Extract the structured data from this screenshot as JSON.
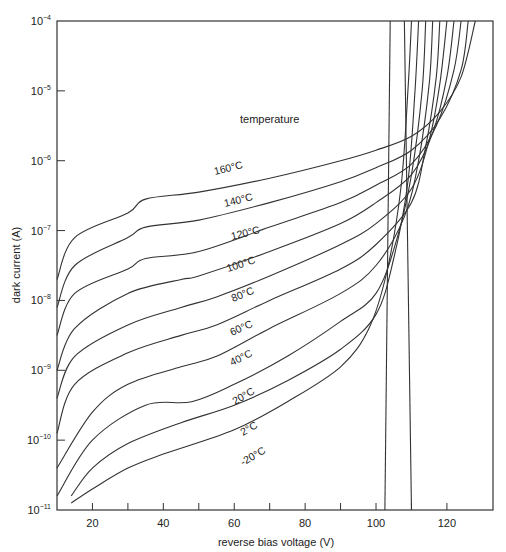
{
  "chart_data": {
    "type": "line",
    "title": "",
    "xlabel": "reverse bias voltage (V)",
    "ylabel": "dark current (A)",
    "xlim": [
      10,
      133
    ],
    "ylim_log10": [
      -11,
      -4
    ],
    "yscale": "log",
    "grid": false,
    "annotation": "temperature",
    "x_ticks": [
      20,
      30,
      40,
      50,
      60,
      70,
      80,
      90,
      100,
      110,
      120
    ],
    "x_tick_labels": [
      "20",
      "",
      "40",
      "",
      "60",
      "",
      "80",
      "",
      "100",
      "",
      "120"
    ],
    "y_ticks": [
      {
        "base": "10",
        "exp": "-4"
      },
      {
        "base": "10",
        "exp": "-5"
      },
      {
        "base": "10",
        "exp": "-6"
      },
      {
        "base": "10",
        "exp": "-7"
      },
      {
        "base": "10",
        "exp": "-8"
      },
      {
        "base": "10",
        "exp": "-9"
      },
      {
        "base": "10",
        "exp": "-10"
      },
      {
        "base": "10",
        "exp": "-11"
      }
    ],
    "series": [
      {
        "name": "160°C",
        "label": "160°C",
        "x": [
          10,
          15,
          30,
          35,
          50,
          70,
          90,
          100,
          110,
          118,
          124,
          128
        ],
        "log10_y": [
          -7.7,
          -7.1,
          -6.75,
          -6.55,
          -6.45,
          -6.25,
          -6.0,
          -5.85,
          -5.65,
          -5.3,
          -4.8,
          -4.0
        ]
      },
      {
        "name": "140°C",
        "label": "140°C",
        "x": [
          10,
          15,
          30,
          35,
          50,
          70,
          90,
          100,
          110,
          118,
          124,
          126
        ],
        "log10_y": [
          -8.1,
          -7.5,
          -7.1,
          -6.95,
          -6.85,
          -6.6,
          -6.3,
          -6.1,
          -5.85,
          -5.4,
          -4.7,
          -4.0
        ]
      },
      {
        "name": "120°C",
        "label": "120°C",
        "x": [
          10,
          15,
          30,
          35,
          50,
          70,
          90,
          100,
          110,
          117,
          122,
          124
        ],
        "log10_y": [
          -8.5,
          -7.9,
          -7.55,
          -7.4,
          -7.3,
          -6.95,
          -6.6,
          -6.35,
          -6.05,
          -5.5,
          -4.7,
          -4.0
        ]
      },
      {
        "name": "100°C",
        "label": "100°C",
        "x": [
          10,
          15,
          30,
          45,
          50,
          70,
          90,
          100,
          110,
          116,
          120,
          122
        ],
        "log10_y": [
          -9.0,
          -8.4,
          -7.9,
          -7.7,
          -7.65,
          -7.3,
          -6.9,
          -6.6,
          -6.2,
          -5.6,
          -4.8,
          -4.0
        ]
      },
      {
        "name": "80°C",
        "label": "80°C",
        "x": [
          10,
          15,
          30,
          45,
          55,
          70,
          90,
          100,
          110,
          115,
          118,
          120
        ],
        "log10_y": [
          -9.4,
          -8.8,
          -8.35,
          -8.1,
          -7.95,
          -7.65,
          -7.2,
          -6.9,
          -6.4,
          -5.7,
          -4.9,
          -4.0
        ]
      },
      {
        "name": "60°C",
        "label": "60°C",
        "x": [
          10,
          15,
          30,
          45,
          55,
          70,
          90,
          100,
          110,
          114,
          117,
          118
        ],
        "log10_y": [
          -9.9,
          -9.2,
          -8.75,
          -8.5,
          -8.35,
          -8.0,
          -7.55,
          -7.2,
          -6.6,
          -5.8,
          -4.8,
          -4.0
        ]
      },
      {
        "name": "40°C",
        "label": "40°C",
        "x": [
          10,
          20,
          30,
          45,
          55,
          70,
          90,
          100,
          108,
          112,
          115,
          116
        ],
        "log10_y": [
          -10.4,
          -9.6,
          -9.2,
          -8.95,
          -8.8,
          -8.4,
          -7.9,
          -7.5,
          -6.8,
          -6.0,
          -4.9,
          -4.0
        ]
      },
      {
        "name": "20°C",
        "label": "20°C",
        "x": [
          10,
          20,
          35,
          48,
          60,
          75,
          90,
          100,
          106,
          110,
          113,
          114
        ],
        "log10_y": [
          -10.8,
          -10.0,
          -9.5,
          -9.45,
          -9.2,
          -8.8,
          -8.3,
          -7.9,
          -7.1,
          -6.2,
          -5.0,
          -4.0
        ]
      },
      {
        "name": "2°C",
        "label": "2°C",
        "x": [
          14,
          20,
          30,
          45,
          60,
          75,
          90,
          100,
          105,
          109,
          111,
          112
        ],
        "log10_y": [
          -10.8,
          -10.4,
          -10.05,
          -9.75,
          -9.5,
          -9.15,
          -8.7,
          -8.2,
          -7.4,
          -6.3,
          -5.0,
          -4.0
        ]
      },
      {
        "name": "-20°C",
        "label": "-20°C",
        "x": [
          14,
          20,
          30,
          40,
          60,
          75,
          90,
          98,
          103,
          107,
          109,
          110
        ],
        "log10_y": [
          -10.9,
          -10.7,
          -10.4,
          -10.2,
          -9.85,
          -9.45,
          -8.95,
          -8.4,
          -7.6,
          -6.4,
          -5.0,
          -4.0
        ]
      }
    ],
    "breakdown_lines": [
      {
        "x_top": 104.0,
        "x_bottom": 102.5
      },
      {
        "x_top": 108.0,
        "x_bottom": 110.0
      }
    ]
  },
  "labels": {
    "x_axis_title": "reverse bias voltage (V)",
    "y_axis_title": "dark current (A)",
    "annotation": "temperature",
    "curve_labels": [
      "160°C",
      "140°C",
      "120°C",
      "100°C",
      "80°C",
      "60°C",
      "40°C",
      "20°C",
      "2°C",
      "-20°C"
    ]
  }
}
